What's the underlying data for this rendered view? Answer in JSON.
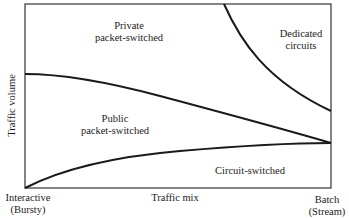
{
  "diagram": {
    "axes": {
      "y_label": "Traffic volume",
      "x_label": "Traffic mix",
      "x_left_tick": [
        "Interactive",
        "(Bursty)"
      ],
      "x_right_tick": [
        "Batch",
        "(Stream)"
      ]
    },
    "regions": [
      {
        "id": "private",
        "lines": [
          "Private",
          "packet-switched"
        ]
      },
      {
        "id": "dedicated",
        "lines": [
          "Dedicated",
          "circuits"
        ]
      },
      {
        "id": "public",
        "lines": [
          "Public",
          "packet-switched"
        ]
      },
      {
        "id": "circuit",
        "lines": [
          "Circuit-switched"
        ]
      }
    ],
    "colors": {
      "line": "#1a1a1a",
      "frame": "#333333",
      "background": "#ffffff"
    }
  }
}
